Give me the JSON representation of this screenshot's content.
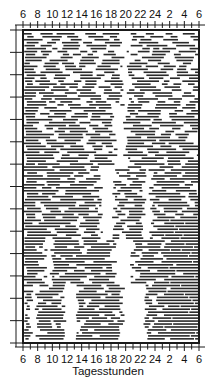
{
  "chart_data": {
    "type": "heatmap",
    "subtype": "actogram",
    "title": "",
    "xlabel": "Tagesstunden",
    "ylabel": "",
    "x_tick_labels": [
      "6",
      "8",
      "10",
      "12",
      "14",
      "16",
      "18",
      "20",
      "22",
      "24",
      "2",
      "4",
      "6"
    ],
    "x_range_hours": [
      6,
      30
    ],
    "y_ticks_count": 15,
    "rows_approx": 104,
    "grid": false,
    "legend": null,
    "gap_bands": [
      {
        "rows": [
          0,
          25
        ],
        "gaps_hours": [
          [
            19.5,
            20.5
          ]
        ]
      },
      {
        "rows": [
          25,
          45
        ],
        "gaps_hours": [
          [
            18.5,
            20.0
          ]
        ]
      },
      {
        "rows": [
          45,
          70
        ],
        "gaps_hours": [
          [
            16.5,
            18.5
          ],
          [
            22.5,
            23.5
          ]
        ]
      },
      {
        "rows": [
          70,
          85
        ],
        "gaps_hours": [
          [
            9.0,
            10.0
          ],
          [
            18.5,
            21.0
          ]
        ]
      },
      {
        "rows": [
          85,
          104
        ],
        "gaps_hours": [
          [
            7.0,
            8.0
          ],
          [
            11.5,
            13.5
          ],
          [
            19.5,
            22.8
          ]
        ]
      }
    ]
  },
  "axes": {
    "top_labels": [
      "6",
      "8",
      "10",
      "12",
      "14",
      "16",
      "18",
      "20",
      "22",
      "24",
      "2",
      "4",
      "6"
    ],
    "bottom_labels": [
      "6",
      "8",
      "10",
      "12",
      "14",
      "16",
      "18",
      "20",
      "22",
      "24",
      "2",
      "4",
      "6"
    ],
    "x_title": "Tagesstunden"
  },
  "style": {
    "ink": "#1a1a1a",
    "bar": "#2a2a2a",
    "background": "#ffffff"
  }
}
